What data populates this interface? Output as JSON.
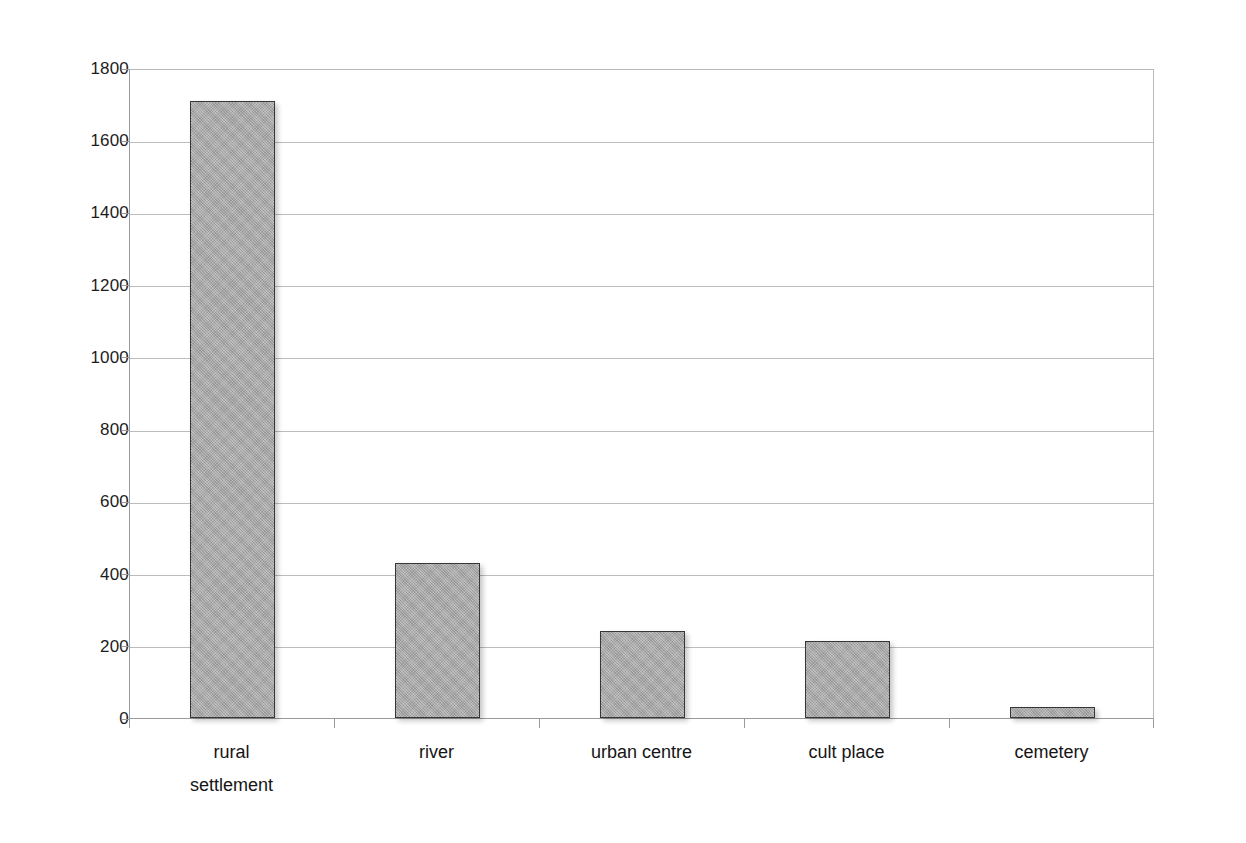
{
  "chart_data": {
    "type": "bar",
    "title": "",
    "subtitle": "",
    "xlabel": "",
    "ylabel": "",
    "categories": [
      "rural settlement",
      "river",
      "urban centre",
      "cult place",
      "cemetery"
    ],
    "values": [
      1710,
      430,
      240,
      212,
      30
    ],
    "series": [
      {
        "name": "count",
        "values": [
          1710,
          430,
          240,
          212,
          30
        ]
      }
    ],
    "ylim": [
      0,
      1800
    ],
    "y_tick_values": [
      0,
      200,
      400,
      600,
      800,
      1000,
      1200,
      1400,
      1600,
      1800
    ],
    "y_tick_labels": [
      "0",
      "200",
      "400",
      "600",
      "800",
      "1000",
      "1200",
      "1400",
      "1600",
      "1800"
    ],
    "x_tick_labels": [
      "rural\nsettlement",
      "river",
      "urban centre",
      "cult place",
      "cemetery"
    ],
    "grid": true,
    "grid_axis": "y",
    "legend": false,
    "legend_position": "none",
    "annotations": [],
    "colors": {
      "bar_fill": "#ababab",
      "bar_border": "#373737",
      "gridline": "#bcbcbc",
      "axis": "#9a9a9a",
      "text": "#1a1a1a",
      "background": "#ffffff"
    }
  }
}
